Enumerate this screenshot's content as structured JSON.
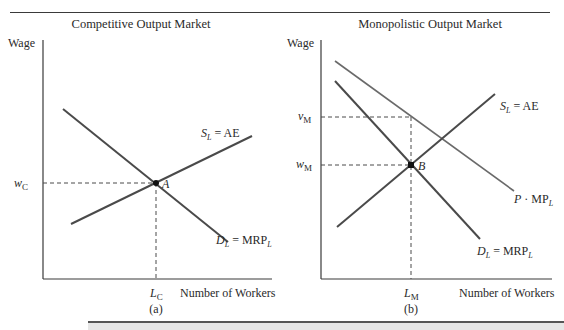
{
  "figure": {
    "panels": [
      {
        "id": "a",
        "title": "Competitive Output Market",
        "y_axis_label": "Wage",
        "x_axis_label": "Number of Workers",
        "caption": "(a)",
        "curves": [
          {
            "name": "supply",
            "label_main": "S",
            "label_sub": "L",
            "label_rest": " = AE"
          },
          {
            "name": "demand",
            "label_main": "D",
            "label_sub": "L",
            "label_rest": " = MRP",
            "label_rest_sub": "L"
          }
        ],
        "equilibrium_point": "A",
        "wage_marker": {
          "main": "w",
          "sub": "C"
        },
        "labor_marker": {
          "main": "L",
          "sub": "C"
        }
      },
      {
        "id": "b",
        "title": "Monopolistic Output Market",
        "y_axis_label": "Wage",
        "x_axis_label": "Number of Workers",
        "caption": "(b)",
        "curves": [
          {
            "name": "supply",
            "label_main": "S",
            "label_sub": "L",
            "label_rest": " = AE"
          },
          {
            "name": "value-marginal-product",
            "label_main": "P",
            "label_rest": " · MP",
            "label_rest_sub": "L"
          },
          {
            "name": "demand",
            "label_main": "D",
            "label_sub": "L",
            "label_rest": " = MRP",
            "label_rest_sub": "L"
          }
        ],
        "equilibrium_point": "B",
        "value_marker": {
          "main": "v",
          "sub": "M"
        },
        "wage_marker": {
          "main": "w",
          "sub": "M"
        },
        "labor_marker": {
          "main": "L",
          "sub": "M"
        }
      }
    ],
    "colors": {
      "curve": "#4a4a4a",
      "axis": "#3a3a3a",
      "bar": "#e6e6e6"
    }
  }
}
